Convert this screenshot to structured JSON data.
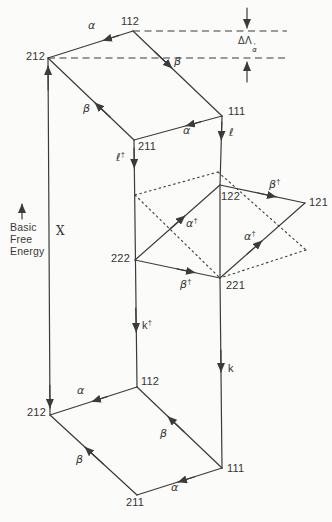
{
  "figure": {
    "background_color": "#fbfbf9",
    "line_color": "#3b3b3b"
  },
  "states": {
    "top_112": "112",
    "top_212": "212",
    "top_111": "111",
    "top_211": "211",
    "mid_122": "122",
    "mid_121": "121",
    "mid_222": "222",
    "mid_221": "221",
    "bot_112": "112",
    "bot_212": "212",
    "bot_111": "111",
    "bot_211": "211"
  },
  "rates": {
    "alpha": "α",
    "beta": "β",
    "ell": "ℓ",
    "k": "k",
    "dagger": "†",
    "x": "X"
  },
  "annotations": {
    "energy_axis": {
      "line1": "Basic",
      "line2": "Free",
      "line3": "Energy"
    },
    "delta": {
      "base": "ΔΛ",
      "prime": "′",
      "sub": "α"
    }
  }
}
